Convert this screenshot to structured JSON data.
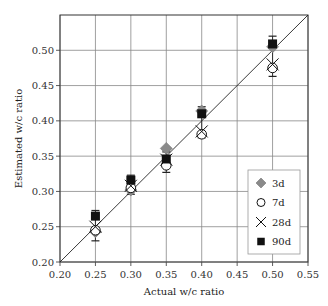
{
  "chart_data": {
    "type": "scatter",
    "title": "",
    "xlabel": "Actual w/c ratio",
    "ylabel": "Estimated w/c ratio",
    "xlim": [
      0.2,
      0.55
    ],
    "ylim": [
      0.2,
      0.55
    ],
    "xticks": [
      "0.20",
      "0.25",
      "0.30",
      "0.35",
      "0.40",
      "0.45",
      "0.50",
      "0.55"
    ],
    "yticks": [
      "0.20",
      "0.25",
      "0.30",
      "0.35",
      "0.40",
      "0.45",
      "0.50"
    ],
    "grid": true,
    "legend_position": "lower right",
    "reference_line": "y = x",
    "x": [
      0.25,
      0.3,
      0.35,
      0.4,
      0.5
    ],
    "series": [
      {
        "name": "3d",
        "marker": "diamond",
        "color": "#8a8a8a",
        "values": [
          0.243,
          0.302,
          0.361,
          0.414,
          0.505
        ]
      },
      {
        "name": "7d",
        "marker": "circle",
        "color": "#000000",
        "values": [
          0.245,
          0.305,
          0.337,
          0.381,
          0.475
        ]
      },
      {
        "name": "28d",
        "marker": "x",
        "color": "#000000",
        "values": [
          0.25,
          0.308,
          0.345,
          0.385,
          0.48
        ]
      },
      {
        "name": "90d",
        "marker": "square",
        "color": "#000000",
        "values": [
          0.265,
          0.316,
          0.346,
          0.41,
          0.509
        ]
      }
    ],
    "error_bars": [
      {
        "x": 0.25,
        "low": 0.23,
        "high": 0.273
      },
      {
        "x": 0.3,
        "low": 0.296,
        "high": 0.323
      },
      {
        "x": 0.35,
        "low": 0.327,
        "high": 0.356
      },
      {
        "x": 0.4,
        "low": 0.376,
        "high": 0.42
      },
      {
        "x": 0.5,
        "low": 0.463,
        "high": 0.52
      }
    ]
  }
}
